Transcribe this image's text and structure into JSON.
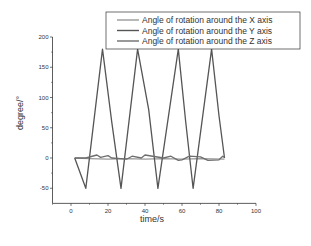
{
  "chart_data": {
    "type": "line",
    "title": "",
    "xlabel": "time/s",
    "ylabel": "degree/°",
    "xlim": [
      -10,
      100
    ],
    "ylim": [
      -75,
      200
    ],
    "xticks": [
      0,
      20,
      40,
      60,
      80,
      100
    ],
    "yticks": [
      -50,
      0,
      50,
      100,
      150,
      200
    ],
    "grid": false,
    "legend_position": "top-right",
    "series": [
      {
        "name": "Angle of rotation around the X axis",
        "color": "#9a9a9a",
        "x": [
          2,
          10,
          20,
          30,
          40,
          50,
          60,
          70,
          83
        ],
        "y": [
          0,
          -1,
          -2,
          -1,
          -2,
          -1,
          -2,
          -1,
          -2
        ]
      },
      {
        "name": "Angle of rotation around the Y axis",
        "color": "#555555",
        "x": [
          2,
          8,
          17,
          22,
          27,
          36,
          42,
          47,
          58,
          62,
          66,
          76,
          80,
          83
        ],
        "y": [
          0,
          -50,
          180,
          60,
          -50,
          180,
          80,
          -50,
          180,
          60,
          -50,
          180,
          70,
          0
        ]
      },
      {
        "name": "Angle of rotation around the Z axis",
        "color": "#6e6e6e",
        "x": [
          2,
          8,
          14,
          16,
          20,
          22,
          30,
          33,
          38,
          40,
          50,
          54,
          58,
          60,
          64,
          70,
          74,
          80,
          82,
          83
        ],
        "y": [
          0,
          0,
          5,
          1,
          4,
          0,
          -2,
          3,
          0,
          5,
          0,
          3,
          -4,
          -3,
          3,
          2,
          -4,
          -3,
          3,
          1
        ]
      }
    ]
  }
}
